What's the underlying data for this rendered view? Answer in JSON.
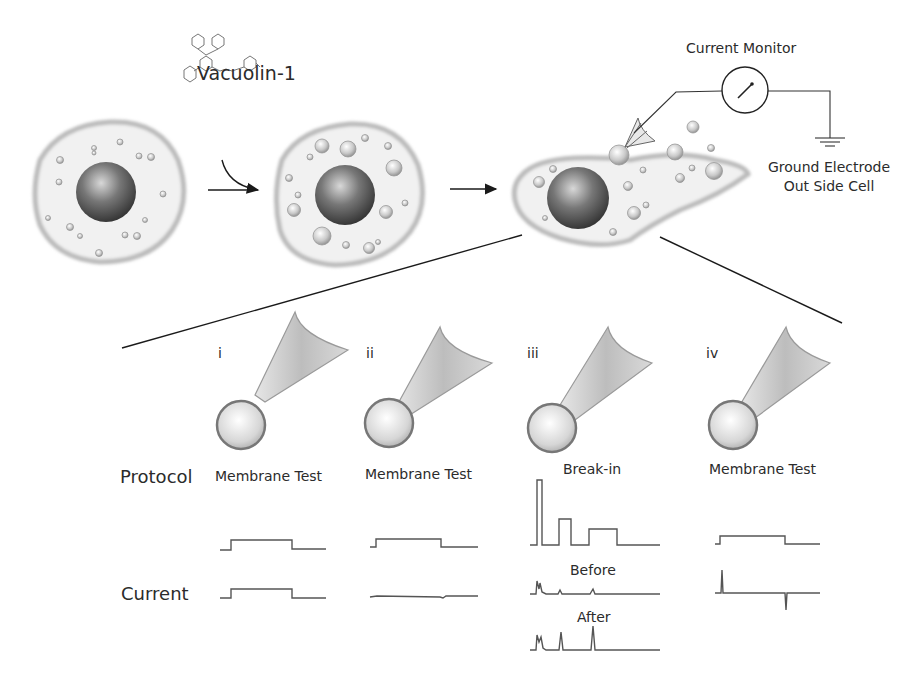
{
  "figure": {
    "compound": {
      "name": "Vacuolin-1"
    },
    "setup": {
      "monitor_label": "Current Monitor",
      "ground_label_line1": "Ground Electrode",
      "ground_label_line2": "Out Side Cell"
    },
    "row_labels": {
      "protocol": "Protocol",
      "current": "Current"
    },
    "panels": [
      {
        "id": "i",
        "roman": "i",
        "title": "Membrane Test",
        "state": "pipette approaching vesicle"
      },
      {
        "id": "ii",
        "roman": "ii",
        "title": "Membrane Test",
        "state": "gigaseal formed"
      },
      {
        "id": "iii",
        "roman": "iii",
        "title": "Break-in",
        "state": "break-in pulses",
        "sub_labels": {
          "before": "Before",
          "after": "After"
        }
      },
      {
        "id": "iv",
        "roman": "iv",
        "title": "Membrane Test",
        "state": "whole-vacuole configuration"
      }
    ],
    "colors": {
      "line": "#1a1a1a",
      "trace": "#555555",
      "cell_fill": "#f1f1f1",
      "nucleus": "#4a4a4a"
    }
  }
}
